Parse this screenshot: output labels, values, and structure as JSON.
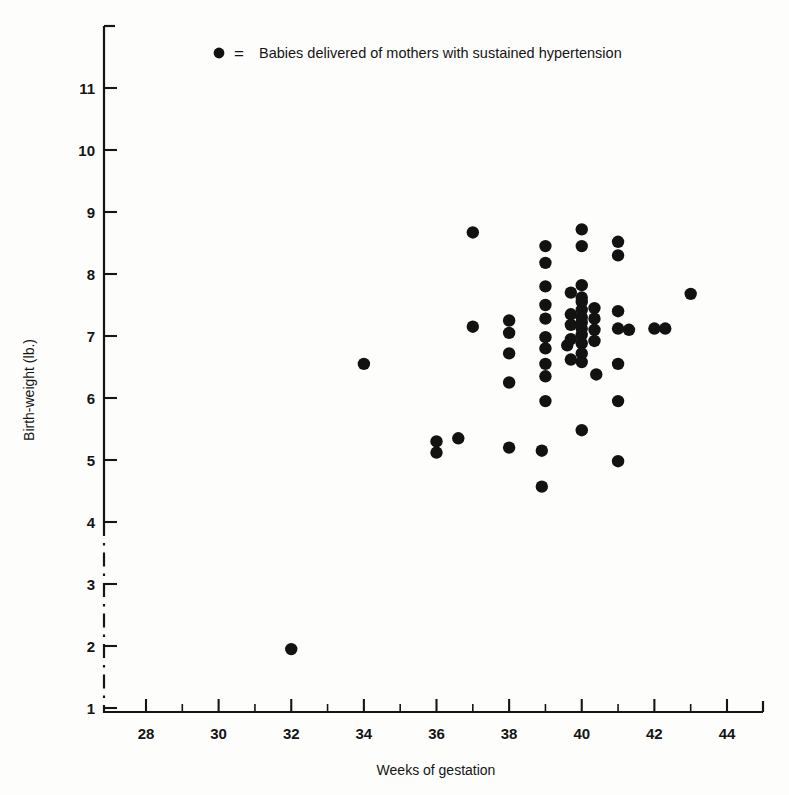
{
  "figure": {
    "title": "",
    "legend": {
      "marker": "filled-circle",
      "equals": "=",
      "label": "Babies delivered of mothers with sustained hypertension"
    },
    "axes": {
      "x_title": "Weeks of gestation",
      "y_title": "Birth-weight (lb.)",
      "x_tick_labels": [
        "28",
        "30",
        "32",
        "34",
        "36",
        "38",
        "40",
        "42",
        "44"
      ],
      "y_tick_labels": [
        "11",
        "10",
        "9",
        "8",
        "7",
        "6",
        "5",
        "4",
        "3",
        "2",
        "1"
      ]
    },
    "colors": {
      "ink": "#151515",
      "point": "#121212",
      "paper": "#fdfdfb"
    }
  },
  "chart_data": {
    "type": "scatter",
    "title": "",
    "xlabel": "Weeks of gestation",
    "ylabel": "Birth-weight (lb.)",
    "xlim": [
      27,
      45
    ],
    "ylim": [
      1,
      11.8
    ],
    "xticks": [
      28,
      30,
      32,
      34,
      36,
      38,
      40,
      42,
      44
    ],
    "xminorticks": [
      29,
      31,
      33,
      35,
      37,
      39,
      41,
      43,
      45
    ],
    "yticks": [
      1,
      2,
      3,
      4,
      5,
      6,
      7,
      8,
      9,
      10,
      11
    ],
    "grid": false,
    "legend_position": "top-center",
    "axis_break": {
      "axis": "y",
      "from": 1.0,
      "to": 4.0,
      "style": "dash-dot"
    },
    "series": [
      {
        "name": "Babies delivered of mothers with sustained hypertension",
        "marker": "o",
        "color": "#121212",
        "points": [
          [
            32.0,
            1.95
          ],
          [
            34.0,
            6.55
          ],
          [
            36.0,
            5.3
          ],
          [
            36.0,
            5.12
          ],
          [
            36.6,
            5.35
          ],
          [
            37.0,
            8.67
          ],
          [
            37.0,
            7.15
          ],
          [
            38.0,
            7.25
          ],
          [
            38.0,
            7.05
          ],
          [
            38.0,
            6.72
          ],
          [
            38.0,
            6.25
          ],
          [
            38.0,
            5.2
          ],
          [
            39.0,
            8.45
          ],
          [
            39.0,
            8.18
          ],
          [
            39.0,
            7.8
          ],
          [
            39.0,
            7.5
          ],
          [
            39.0,
            7.28
          ],
          [
            39.0,
            6.98
          ],
          [
            39.0,
            6.8
          ],
          [
            39.0,
            6.55
          ],
          [
            39.0,
            6.35
          ],
          [
            39.0,
            5.95
          ],
          [
            38.9,
            5.15
          ],
          [
            38.9,
            4.57
          ],
          [
            39.6,
            6.85
          ],
          [
            40.0,
            8.72
          ],
          [
            40.0,
            8.45
          ],
          [
            40.0,
            7.82
          ],
          [
            40.0,
            7.62
          ],
          [
            40.0,
            7.55
          ],
          [
            40.0,
            7.42
          ],
          [
            40.0,
            7.3
          ],
          [
            40.0,
            7.22
          ],
          [
            40.0,
            7.12
          ],
          [
            40.0,
            7.02
          ],
          [
            40.0,
            6.88
          ],
          [
            40.0,
            6.72
          ],
          [
            40.0,
            6.58
          ],
          [
            40.0,
            5.48
          ],
          [
            39.7,
            7.7
          ],
          [
            39.7,
            7.35
          ],
          [
            39.7,
            7.18
          ],
          [
            39.7,
            6.95
          ],
          [
            39.7,
            6.62
          ],
          [
            40.35,
            7.45
          ],
          [
            40.35,
            7.28
          ],
          [
            40.35,
            7.1
          ],
          [
            40.35,
            6.92
          ],
          [
            40.4,
            6.38
          ],
          [
            41.0,
            8.52
          ],
          [
            41.0,
            8.3
          ],
          [
            41.0,
            7.4
          ],
          [
            41.0,
            7.12
          ],
          [
            41.3,
            7.1
          ],
          [
            41.0,
            6.55
          ],
          [
            41.0,
            5.95
          ],
          [
            41.0,
            4.98
          ],
          [
            42.0,
            7.12
          ],
          [
            42.3,
            7.12
          ],
          [
            43.0,
            7.68
          ]
        ]
      }
    ]
  }
}
